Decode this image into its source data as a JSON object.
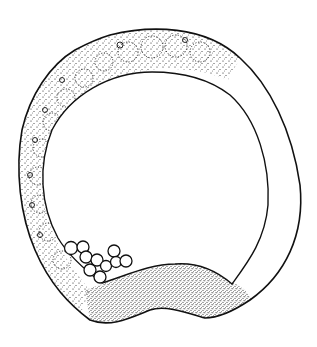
{
  "figure": {
    "type": "scientific line drawing",
    "style": "stippled ink illustration",
    "colors": {
      "background": "#ffffff",
      "ink": "#111111"
    },
    "parts": [
      {
        "id": "outer-wall",
        "description": "outer epithelial wall"
      },
      {
        "id": "cell-layer",
        "description": "stippled cell layer with rounded nuclei along top and left"
      },
      {
        "id": "cavity",
        "description": "large central cavity (blastocoel)"
      },
      {
        "id": "vegetal-plate",
        "description": "densely stippled thickened bottom region"
      },
      {
        "id": "cell-cluster",
        "description": "cluster of small round cells at lower left of cavity"
      }
    ],
    "labels": []
  }
}
